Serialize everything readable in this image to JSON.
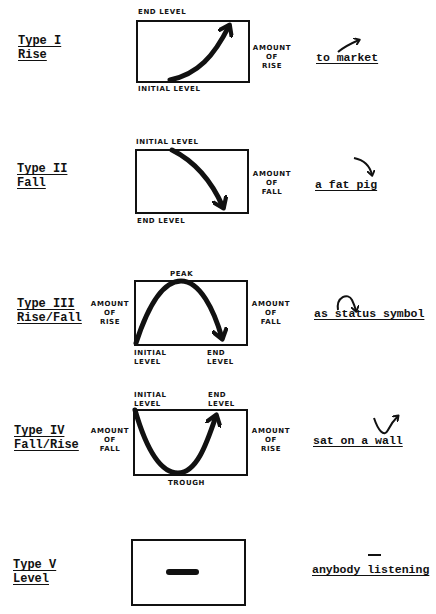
{
  "rows": [
    {
      "type": "Type I",
      "name": "Rise",
      "labels": {
        "top": "END LEVEL",
        "bottom": "INITIAL LEVEL",
        "right": [
          "AMOUNT",
          "OF",
          "RISE"
        ]
      },
      "phrase": "to market"
    },
    {
      "type": "Type II",
      "name": "Fall",
      "labels": {
        "top": "INITIAL LEVEL",
        "bottom": "END LEVEL",
        "right": [
          "AMOUNT",
          "OF",
          "FALL"
        ]
      },
      "phrase": "a fat pig"
    },
    {
      "type": "Type III",
      "name": "Rise/Fall",
      "labels": {
        "top": "PEAK",
        "bottom_left": [
          "INITIAL",
          "LEVEL"
        ],
        "bottom_right": [
          "END",
          "LEVEL"
        ],
        "left": [
          "AMOUNT",
          "OF",
          "RISE"
        ],
        "right": [
          "AMOUNT",
          "OF",
          "FALL"
        ]
      },
      "phrase": "as status symbol"
    },
    {
      "type": "Type IV",
      "name": "Fall/Rise",
      "labels": {
        "top_left": [
          "INITIAL",
          "LEVEL"
        ],
        "top_right": [
          "END",
          "LEVEL"
        ],
        "bottom": "TROUGH",
        "left": [
          "AMOUNT",
          "OF",
          "FALL"
        ],
        "right": [
          "AMOUNT",
          "OF",
          "RISE"
        ]
      },
      "phrase": "sat on a wall"
    },
    {
      "type": "Type V",
      "name": "Level",
      "labels": {},
      "phrase": "anybody listening"
    }
  ]
}
